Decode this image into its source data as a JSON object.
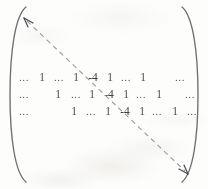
{
  "figure": {
    "kind": "matrix-with-diagonal-annotation",
    "bracket_left": "(",
    "bracket_right": ")",
    "ink_color": "#4c4c50",
    "arrow_color": "#8e8e93",
    "background_color": "#fdfdfc"
  },
  "matrix": {
    "rows": [
      {
        "id": "row-1",
        "cells": [
          {
            "text": "...",
            "x": 24,
            "type": "ellipsis"
          },
          {
            "text": "1",
            "x": 42,
            "type": "value"
          },
          {
            "text": "...",
            "x": 59,
            "type": "ellipsis"
          },
          {
            "text": "1",
            "x": 76,
            "type": "value"
          },
          {
            "text": "-4",
            "x": 93,
            "type": "diagonal"
          },
          {
            "text": "1",
            "x": 110,
            "type": "value"
          },
          {
            "text": "...",
            "x": 126,
            "type": "ellipsis"
          },
          {
            "text": "1",
            "x": 143,
            "type": "value"
          },
          {
            "text": "...",
            "x": 180,
            "type": "ellipsis"
          }
        ]
      },
      {
        "id": "row-2",
        "cells": [
          {
            "text": "...",
            "x": 24,
            "type": "ellipsis"
          },
          {
            "text": "1",
            "x": 58,
            "type": "value"
          },
          {
            "text": "...",
            "x": 76,
            "type": "ellipsis"
          },
          {
            "text": "1",
            "x": 92,
            "type": "value"
          },
          {
            "text": "-4",
            "x": 109,
            "type": "diagonal"
          },
          {
            "text": "1",
            "x": 126,
            "type": "value"
          },
          {
            "text": "...",
            "x": 141,
            "type": "ellipsis"
          },
          {
            "text": "1",
            "x": 159,
            "type": "value"
          },
          {
            "text": "...",
            "x": 190,
            "type": "ellipsis"
          }
        ]
      },
      {
        "id": "row-3",
        "cells": [
          {
            "text": "...",
            "x": 24,
            "type": "ellipsis"
          },
          {
            "text": "1",
            "x": 74,
            "type": "value"
          },
          {
            "text": "...",
            "x": 91,
            "type": "ellipsis"
          },
          {
            "text": "1",
            "x": 108,
            "type": "value"
          },
          {
            "text": "-4",
            "x": 125,
            "type": "diagonal"
          },
          {
            "text": "1",
            "x": 142,
            "type": "value"
          },
          {
            "text": "...",
            "x": 157,
            "type": "ellipsis"
          },
          {
            "text": "1",
            "x": 175,
            "type": "value"
          },
          {
            "text": "...",
            "x": 192,
            "type": "ellipsis"
          }
        ]
      }
    ]
  },
  "annotation": {
    "name": "main-diagonal-double-arrow",
    "style": "dashed",
    "start": {
      "x": 26,
      "y": 20
    },
    "end": {
      "x": 186,
      "y": 172
    },
    "arrowheads": "both"
  }
}
